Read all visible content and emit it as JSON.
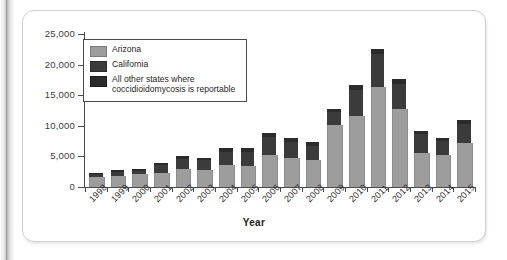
{
  "chart_data": {
    "type": "bar",
    "stacked": true,
    "title": "",
    "xlabel": "Year",
    "ylabel": "",
    "ylim": [
      0,
      25000
    ],
    "yticks": [
      0,
      5000,
      10000,
      15000,
      20000,
      25000
    ],
    "ytick_labels": [
      "0",
      "5,000",
      "10,000",
      "15,000",
      "20,000",
      "25,000"
    ],
    "grid": false,
    "legend_position": "upper-left-inside",
    "categories": [
      "1998",
      "1999",
      "2000",
      "2001",
      "2002",
      "2003",
      "2004",
      "2005",
      "2006",
      "2007",
      "2008",
      "2009",
      "2010",
      "2011",
      "2012",
      "2013",
      "2014",
      "2015"
    ],
    "series": [
      {
        "name": "Arizona",
        "color": "#9d9d9d",
        "values": [
          1700,
          1800,
          2100,
          2300,
          3000,
          2700,
          3600,
          3400,
          5200,
          4700,
          4400,
          10100,
          11600,
          16300,
          12700,
          5600,
          5300,
          7200
        ]
      },
      {
        "name": "California",
        "color": "#3b3b3b",
        "values": [
          450,
          700,
          550,
          1300,
          1600,
          1700,
          2200,
          2400,
          2900,
          2700,
          2300,
          2100,
          4200,
          5400,
          4200,
          3000,
          2200,
          3100
        ]
      },
      {
        "name": "All other states where coccidioidomycosis is reportable",
        "color": "#2b2b2b",
        "values": [
          150,
          300,
          250,
          400,
          400,
          400,
          500,
          500,
          700,
          600,
          600,
          600,
          800,
          800,
          700,
          600,
          500,
          600
        ]
      }
    ],
    "totals": [
      2300,
      2800,
      2900,
      4000,
      5000,
      4800,
      6300,
      6300,
      8800,
      8000,
      7300,
      12800,
      16600,
      22500,
      17600,
      9200,
      8000,
      10900
    ]
  },
  "legend": {
    "items": [
      {
        "label": "Arizona",
        "swatch": "arizona-swatch"
      },
      {
        "label": "California",
        "swatch": "california-swatch"
      },
      {
        "label_line1": "All other states where",
        "label_line2": "coccidioidomycosis is reportable",
        "swatch": "other-states-swatch"
      }
    ]
  },
  "axis": {
    "x_title": "Year"
  },
  "colors": {
    "arizona": "#9d9d9d",
    "california": "#3b3b3b",
    "other_states": "#2b2b2b",
    "axis": "#4a4a4a"
  }
}
